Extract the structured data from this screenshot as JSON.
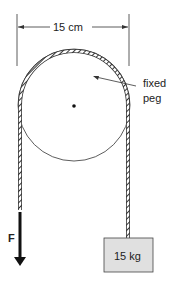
{
  "diagram": {
    "dimension_label": "15 cm",
    "peg_label_line1": "fixed",
    "peg_label_line2": "peg",
    "force_label": "F",
    "mass_label": "15 kg",
    "colors": {
      "line": "#222222",
      "box_fill": "#e0e0e0",
      "box_stroke": "#444444"
    }
  }
}
